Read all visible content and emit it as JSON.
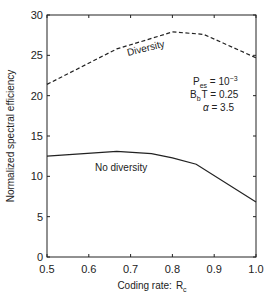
{
  "chart_data": {
    "type": "line",
    "title": "",
    "xlabel": "Coding rate:",
    "xlabel_symbol": "R",
    "xlabel_subscript": "c",
    "ylabel": "Normalized spectral efficiency",
    "xlim": [
      0.5,
      1.0
    ],
    "ylim": [
      0,
      30
    ],
    "xticks": [
      0.5,
      0.6,
      0.7,
      0.8,
      0.9,
      1.0
    ],
    "xtick_labels": [
      "0.5",
      "0.6",
      "0.7",
      "0.8",
      "0.9",
      "1.0"
    ],
    "yticks": [
      0,
      5,
      10,
      15,
      20,
      25,
      30
    ],
    "ytick_labels": [
      "0",
      "5",
      "10",
      "15",
      "20",
      "25",
      "30"
    ],
    "grid": false,
    "series": [
      {
        "name": "Diversity",
        "style": "dashed",
        "x": [
          0.5,
          0.667,
          0.75,
          0.8,
          0.875,
          1.0
        ],
        "y": [
          21.4,
          25.8,
          27.1,
          27.9,
          27.6,
          24.7
        ]
      },
      {
        "name": "No diversity",
        "style": "solid",
        "x": [
          0.5,
          0.667,
          0.75,
          0.8,
          0.857,
          1.0
        ],
        "y": [
          12.5,
          13.1,
          12.8,
          12.3,
          11.5,
          6.8
        ]
      }
    ],
    "annotations": {
      "line1": {
        "symbol": "P",
        "sub": "es",
        "rest": " = 10",
        "sup": "−3"
      },
      "line2": {
        "symbol": "B",
        "sub": "b",
        "rest": "T = 0.25"
      },
      "line3": {
        "symbol": "α",
        "rest": " = 3.5"
      }
    },
    "series_labels": [
      "Diversity",
      "No diversity"
    ]
  }
}
